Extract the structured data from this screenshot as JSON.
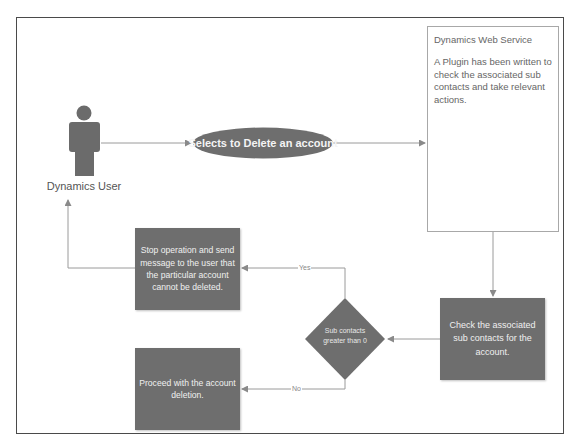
{
  "diagram": {
    "actor": {
      "label": "Dynamics User",
      "icon": "person-icon",
      "color": "#6b6b6b"
    },
    "action_ellipse": {
      "label": "Selects to Delete an account",
      "color": "#6e6e6e"
    },
    "web_service": {
      "title": "Dynamics Web Service",
      "description": "A Plugin has been written to check the associated sub contacts and take relevant actions."
    },
    "check_step": {
      "label": "Check the associated sub contacts for the account."
    },
    "decision": {
      "label_line1": "Sub contacts",
      "label_line2": "greater than 0"
    },
    "edges": {
      "yes_label": "Yes",
      "no_label": "No"
    },
    "stop_step": {
      "label": "Stop operation and send message to the user that the particular account cannot be deleted."
    },
    "proceed_step": {
      "label": "Proceed with the account deletion."
    },
    "colors": {
      "shape_fill": "#6e6e6e",
      "line": "#8a8a8a",
      "frame": "#4a4a4a"
    }
  }
}
